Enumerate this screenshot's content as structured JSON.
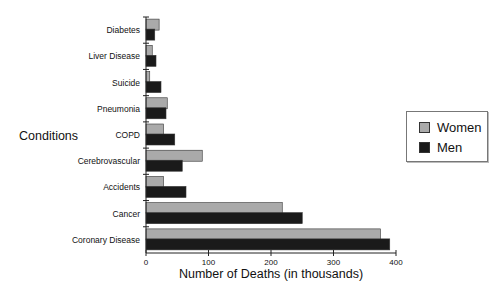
{
  "chart_data": {
    "type": "bar",
    "orientation": "horizontal",
    "title": "",
    "xlabel": "Number of Deaths (in thousands)",
    "ylabel": "Conditions",
    "xlim": [
      0,
      400
    ],
    "xticks": [
      0,
      100,
      200,
      300,
      400
    ],
    "grid": false,
    "legend_position": "right",
    "categories": [
      "Diabetes",
      "Liver Disease",
      "Suicide",
      "Pneumonia",
      "COPD",
      "Cerebrovascular",
      "Accidents",
      "Cancer",
      "Coronary Disease"
    ],
    "series": [
      {
        "name": "Women",
        "color": "#aaaaaa",
        "values": [
          21,
          10,
          6,
          34,
          28,
          90,
          28,
          218,
          375
        ]
      },
      {
        "name": "Men",
        "color": "#1a1a1a",
        "values": [
          14,
          16,
          24,
          32,
          46,
          58,
          64,
          250,
          390
        ]
      }
    ]
  },
  "legend": {
    "items": [
      {
        "label": "Women",
        "color": "#aaaaaa"
      },
      {
        "label": "Men",
        "color": "#1a1a1a"
      }
    ]
  },
  "axes": {
    "xlabel": "Number of Deaths (in thousands)",
    "ylabel": "Conditions"
  }
}
